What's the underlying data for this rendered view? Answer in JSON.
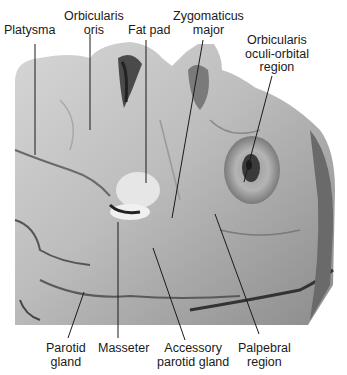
{
  "figure": {
    "labels_top": [
      {
        "id": "platysma",
        "lines": [
          "Platysma"
        ]
      },
      {
        "id": "orbicularis-oris",
        "lines": [
          "Orbicularis",
          "oris"
        ]
      },
      {
        "id": "fat-pad",
        "lines": [
          "Fat pad"
        ]
      },
      {
        "id": "zygomaticus-major",
        "lines": [
          "Zygomaticus",
          "major"
        ]
      },
      {
        "id": "orbicularis-oculi",
        "lines": [
          "Orbicularis",
          "oculi-orbital",
          "region"
        ]
      }
    ],
    "labels_bottom": [
      {
        "id": "parotid-gland",
        "lines": [
          "Parotid",
          "gland"
        ]
      },
      {
        "id": "masseter",
        "lines": [
          "Masseter"
        ]
      },
      {
        "id": "accessory-parotid",
        "lines": [
          "Accessory",
          "parotid gland"
        ]
      },
      {
        "id": "palpebral-region",
        "lines": [
          "Palpebral",
          "region"
        ]
      }
    ]
  }
}
